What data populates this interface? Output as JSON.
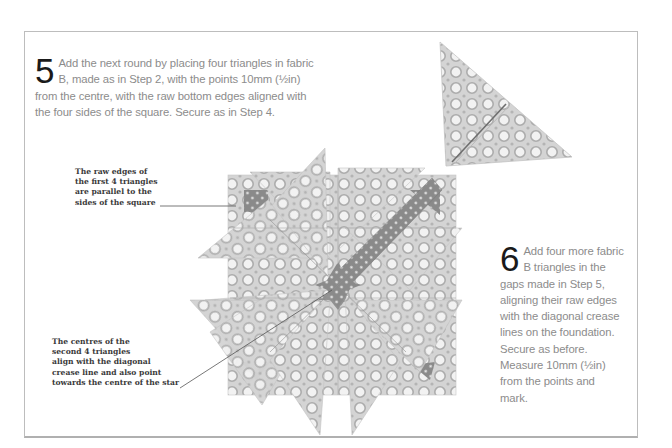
{
  "steps": [
    {
      "number": "5",
      "text": "Add the next round by placing four triangles in fabric B, made as in Step 2, with the points 10mm (½in) from the centre, with the raw bottom edges aligned with the four sides of the square. Secure as in Step 4."
    },
    {
      "number": "6",
      "text": "Add four more fabric B triangles in the gaps made in Step 5, aligning their raw edges with the diagonal crease lines on the foundation. Secure as before. Measure 10mm (½in) from the points and mark."
    }
  ],
  "annotations": [
    {
      "text": "The raw edges of\nthe first 4 triangles\nare parallel to the\nsides of the square"
    },
    {
      "text": "The centres of the\nsecond 4 triangles\nalign with the diagonal\ncrease line and also point\ntowards the centre of the star"
    }
  ],
  "illustrations": {
    "star": "folded-fabric-star",
    "triangle": "folded-fabric-triangle"
  },
  "colors": {
    "fabric_b_base": "#d2d2d2",
    "fabric_b_ring": "#b0b0b0",
    "fabric_a_dark": "#8a8a8a",
    "frame": "#bdbdbd",
    "body_text": "#8c8c8c",
    "step_number": "#1a1a1a"
  }
}
